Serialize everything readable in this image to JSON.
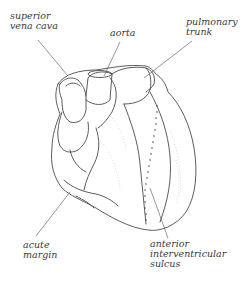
{
  "diagram": {
    "line_color": "#4a4a4a",
    "leader_color": "#6a6a6a",
    "labels": {
      "superior_vena_cava": {
        "line1": "superior",
        "line2": "vena cava"
      },
      "aorta": {
        "line1": "aorta"
      },
      "pulmonary_trunk": {
        "line1": "pulmonary",
        "line2": "trunk"
      },
      "acute_margin": {
        "line1": "acute",
        "line2": "margin"
      },
      "anterior_interventricular_sulcus": {
        "line1": "anterior",
        "line2": "interventricular",
        "line3": "sulcus"
      }
    }
  }
}
